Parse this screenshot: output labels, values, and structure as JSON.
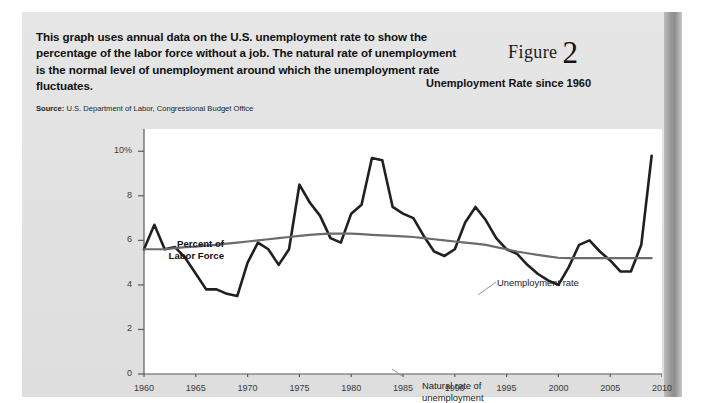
{
  "figure": {
    "intro_text": "This graph uses annual data on the U.S. unemployment rate to show the percentage of the labor force without a job. The natural rate of unemployment is the normal level of unemployment around which the unemployment rate fluctuates.",
    "source_label": "Source:",
    "source_text": " U.S. Department of Labor, Congressional Budget Office",
    "figure_word": "Figure",
    "figure_number": "2",
    "subtitle": "Unemployment Rate since 1960"
  },
  "chart_data": {
    "type": "line",
    "title": "Unemployment Rate since 1960",
    "xlabel": "",
    "ylabel": "Percent of Labor Force",
    "xlim": [
      1960,
      2010
    ],
    "ylim": [
      0,
      11
    ],
    "xticks": [
      1960,
      1965,
      1970,
      1975,
      1980,
      1985,
      1990,
      1995,
      2000,
      2005,
      2010
    ],
    "yticks": [
      0,
      2,
      4,
      6,
      8,
      10
    ],
    "ytick_labels": [
      "0",
      "2",
      "4",
      "6",
      "8",
      "10%"
    ],
    "grid": false,
    "legend": "inline-annotations",
    "x": [
      1960,
      1961,
      1962,
      1963,
      1964,
      1965,
      1966,
      1967,
      1968,
      1969,
      1970,
      1971,
      1972,
      1973,
      1974,
      1975,
      1976,
      1977,
      1978,
      1979,
      1980,
      1981,
      1982,
      1983,
      1984,
      1985,
      1986,
      1987,
      1988,
      1989,
      1990,
      1991,
      1992,
      1993,
      1994,
      1995,
      1996,
      1997,
      1998,
      1999,
      2000,
      2001,
      2002,
      2003,
      2004,
      2005,
      2006,
      2007,
      2008,
      2009
    ],
    "series": [
      {
        "name": "Unemployment rate",
        "color": "#231f20",
        "width": 2.6,
        "values": [
          5.6,
          6.7,
          5.6,
          5.7,
          5.2,
          4.5,
          3.8,
          3.8,
          3.6,
          3.5,
          5.0,
          5.9,
          5.6,
          4.9,
          5.6,
          8.5,
          7.7,
          7.1,
          6.1,
          5.9,
          7.2,
          7.6,
          9.7,
          9.6,
          7.5,
          7.2,
          7.0,
          6.2,
          5.5,
          5.3,
          5.6,
          6.8,
          7.5,
          6.9,
          6.1,
          5.6,
          5.4,
          4.9,
          4.5,
          4.2,
          4.0,
          4.8,
          5.8,
          6.0,
          5.5,
          5.1,
          4.6,
          4.6,
          5.8,
          9.8
        ]
      },
      {
        "name": "Natural rate of unemployment",
        "color": "#6b6b6b",
        "width": 2.2,
        "values": [
          5.6,
          5.6,
          5.6,
          5.65,
          5.7,
          5.72,
          5.76,
          5.8,
          5.85,
          5.9,
          5.95,
          6.0,
          6.05,
          6.1,
          6.15,
          6.2,
          6.25,
          6.28,
          6.3,
          6.3,
          6.3,
          6.28,
          6.25,
          6.22,
          6.2,
          6.18,
          6.15,
          6.1,
          6.05,
          6.0,
          5.95,
          5.9,
          5.85,
          5.8,
          5.7,
          5.6,
          5.5,
          5.42,
          5.35,
          5.28,
          5.22,
          5.2,
          5.2,
          5.2,
          5.2,
          5.2,
          5.2,
          5.2,
          5.2,
          5.2
        ]
      }
    ],
    "annotations": [
      {
        "name": "unemployment-rate-annotation",
        "text": "Unemployment rate",
        "x": 1985,
        "y": 10.2
      },
      {
        "name": "natural-rate-annotation",
        "text": "Natural rate of\nunemployment",
        "x": 1978,
        "y": 4.6
      }
    ]
  },
  "axis_labels": {
    "y_title_line1": "Percent of",
    "y_title_line2": "Labor Force"
  }
}
